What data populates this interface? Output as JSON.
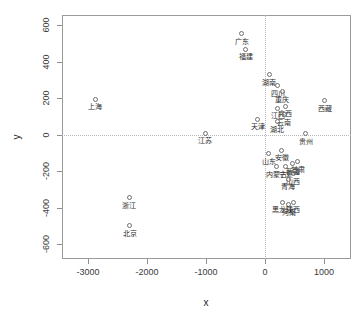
{
  "chart_data": {
    "type": "scatter",
    "title": "",
    "xlabel": "x",
    "ylabel": "y",
    "xlim": [
      -3450,
      1450
    ],
    "ylim": [
      -680,
      660
    ],
    "xticks": [
      -3000,
      -2000,
      -1000,
      0,
      1000
    ],
    "xticklabels": [
      "-3000",
      "-2000",
      "-1000",
      "0",
      "1000"
    ],
    "yticks": [
      600,
      400,
      200,
      0,
      -200,
      -400,
      -600
    ],
    "yticklabels": [
      "600",
      "400",
      "200",
      "0",
      "-200",
      "-400",
      "-600"
    ],
    "grid": false,
    "legend": null,
    "reference_lines": [
      {
        "axis": "x",
        "value": 0,
        "style": "dotted"
      },
      {
        "axis": "y",
        "value": 0,
        "style": "dotted"
      }
    ],
    "marker": "open-circle",
    "points": [
      {
        "label": "上海",
        "x": -2880,
        "y": 195
      },
      {
        "label": "广东",
        "x": -395,
        "y": 555
      },
      {
        "label": "福建",
        "x": -330,
        "y": 470
      },
      {
        "label": "湖南",
        "x": 70,
        "y": 330
      },
      {
        "label": "四川",
        "x": 215,
        "y": 270
      },
      {
        "label": "重庆",
        "x": 295,
        "y": 235
      },
      {
        "label": "西藏",
        "x": 1010,
        "y": 185
      },
      {
        "label": "江西",
        "x": 215,
        "y": 145
      },
      {
        "label": "广西",
        "x": 345,
        "y": 155
      },
      {
        "label": "云南",
        "x": 330,
        "y": 110
      },
      {
        "label": "天津",
        "x": -120,
        "y": 85
      },
      {
        "label": "湖北",
        "x": 205,
        "y": 70
      },
      {
        "label": "江苏",
        "x": -1010,
        "y": 8
      },
      {
        "label": "贵州",
        "x": 690,
        "y": 5
      },
      {
        "label": "山东",
        "x": 65,
        "y": -105
      },
      {
        "label": "安徽",
        "x": 285,
        "y": -85
      },
      {
        "label": "内蒙古",
        "x": 200,
        "y": -175
      },
      {
        "label": "宁夏",
        "x": 350,
        "y": -175
      },
      {
        "label": "新疆",
        "x": 470,
        "y": -160
      },
      {
        "label": "甘肃",
        "x": 555,
        "y": -150
      },
      {
        "label": "山西",
        "x": 480,
        "y": -215
      },
      {
        "label": "青海",
        "x": 395,
        "y": -245
      },
      {
        "label": "黑龙江",
        "x": 290,
        "y": -370
      },
      {
        "label": "河南",
        "x": 400,
        "y": -385
      },
      {
        "label": "陕西",
        "x": 480,
        "y": -370
      },
      {
        "label": "浙江",
        "x": -2300,
        "y": -345
      },
      {
        "label": "北京",
        "x": -2290,
        "y": -500
      }
    ]
  },
  "colors": {
    "frame": "#9a9a9a",
    "marker": "#6e6e6e",
    "text": "#2b2b2b",
    "reference": "#b8b8b8"
  }
}
